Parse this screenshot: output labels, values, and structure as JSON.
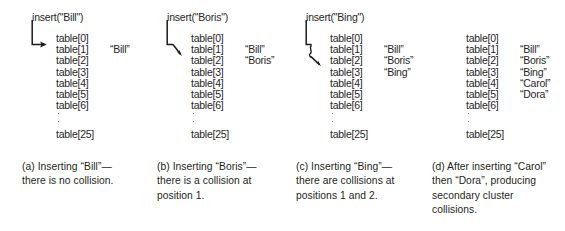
{
  "figure": {
    "slot_label_prefix": "table",
    "ellipsis_marker": "vertical-dots",
    "colors": {
      "text": "#262626",
      "caption_text": "#231f20",
      "arrow": "#1a1a1a",
      "background": "#ffffff"
    },
    "panels": [
      {
        "id": "a",
        "insert_call": "insert(\"Bill\")",
        "arrow_kind": "straight-hook-to-slot-1",
        "arrow_target_index": 1,
        "slots": [
          {
            "label": "table[0]",
            "value": ""
          },
          {
            "label": "table[1]",
            "value": "“Bill”"
          },
          {
            "label": "table[2]",
            "value": ""
          },
          {
            "label": "table[3]",
            "value": ""
          },
          {
            "label": "table[4]",
            "value": ""
          },
          {
            "label": "table[5]",
            "value": ""
          },
          {
            "label": "table[6]",
            "value": ""
          }
        ],
        "last_slot": "table[25]",
        "caption_lines": [
          "(a) Inserting “Bill”—",
          "there is no collision."
        ]
      },
      {
        "id": "b",
        "insert_call": "insert(\"Boris\")",
        "arrow_kind": "hook-then-diagonal-to-slot-2",
        "arrow_target_index": 2,
        "slots": [
          {
            "label": "table[0]",
            "value": ""
          },
          {
            "label": "table[1]",
            "value": "“Bill”"
          },
          {
            "label": "table[2]",
            "value": "“Boris”"
          },
          {
            "label": "table[3]",
            "value": ""
          },
          {
            "label": "table[4]",
            "value": ""
          },
          {
            "label": "table[5]",
            "value": ""
          },
          {
            "label": "table[6]",
            "value": ""
          }
        ],
        "last_slot": "table[25]",
        "caption_lines": [
          "(b) Inserting “Boris”—",
          "there is a collision at",
          "position 1."
        ]
      },
      {
        "id": "c",
        "insert_call": "insert(\"Bing\")",
        "arrow_kind": "hook-then-squiggle-to-slot-3",
        "arrow_target_index": 3,
        "slots": [
          {
            "label": "table[0]",
            "value": ""
          },
          {
            "label": "table[1]",
            "value": "“Bill”"
          },
          {
            "label": "table[2]",
            "value": "“Boris”"
          },
          {
            "label": "table[3]",
            "value": "“Bing”"
          },
          {
            "label": "table[4]",
            "value": ""
          },
          {
            "label": "table[5]",
            "value": ""
          },
          {
            "label": "table[6]",
            "value": ""
          }
        ],
        "last_slot": "table[25]",
        "caption_lines": [
          "(c) Inserting “Bing”—",
          "there are collisions at",
          "positions 1 and 2."
        ]
      },
      {
        "id": "d",
        "insert_call": "",
        "arrow_kind": "none",
        "arrow_target_index": null,
        "slots": [
          {
            "label": "table[0]",
            "value": ""
          },
          {
            "label": "table[1]",
            "value": "“Bill”"
          },
          {
            "label": "table[2]",
            "value": "“Boris”"
          },
          {
            "label": "table[3]",
            "value": "“Bing”"
          },
          {
            "label": "table[4]",
            "value": "“Carol”"
          },
          {
            "label": "table[5]",
            "value": "“Dora”"
          },
          {
            "label": "table[6]",
            "value": ""
          }
        ],
        "last_slot": "table[25]",
        "caption_lines": [
          "(d) After inserting “Carol”",
          "then “Dora”, producing",
          "secondary cluster",
          "collisions."
        ]
      }
    ]
  }
}
